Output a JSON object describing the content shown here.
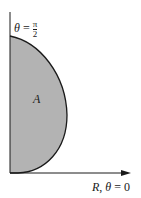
{
  "diagram": {
    "type": "polar-region",
    "region_label": "A",
    "vertical_axis_label": {
      "lhs": "θ",
      "eq": "=",
      "num": "π",
      "den": "2"
    },
    "horizontal_axis_label": {
      "r": "R",
      "sep": ",",
      "lhs": "θ",
      "eq": "=",
      "rhs": "0"
    },
    "colors": {
      "fill": "#b3b3b3",
      "stroke": "#1a1a1a",
      "background": "#ffffff"
    }
  }
}
